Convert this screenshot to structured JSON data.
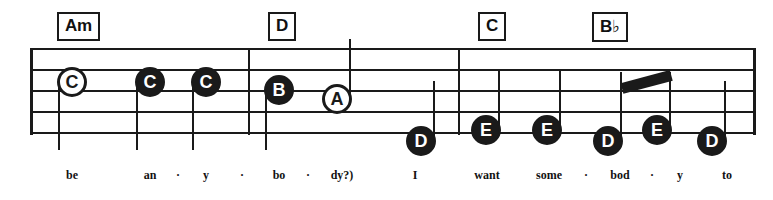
{
  "sheet": {
    "width": 773,
    "height": 200,
    "ink_color": "#1a1a1a",
    "paper_color": "#ffffff"
  },
  "staff": {
    "line_count": 5,
    "left": 30,
    "right": 753,
    "top": 48,
    "bottom": 133,
    "line_spacing": 21,
    "barlines": [
      30,
      248,
      458,
      753
    ]
  },
  "chords": [
    {
      "id": "chord-am",
      "label": "Am",
      "root": "A",
      "quality": "m",
      "accidental": "",
      "x": 57,
      "y": 12
    },
    {
      "id": "chord-d",
      "label": "D",
      "root": "D",
      "quality": "",
      "accidental": "",
      "x": 268,
      "y": 12
    },
    {
      "id": "chord-c",
      "label": "C",
      "root": "C",
      "quality": "",
      "accidental": "",
      "x": 478,
      "y": 12
    },
    {
      "id": "chord-bb",
      "label": "B",
      "root": "B",
      "quality": "",
      "accidental": "♭",
      "x": 592,
      "y": 12
    }
  ],
  "notes": [
    {
      "id": "note-1",
      "letter": "C",
      "head": "hollow",
      "duration": "half",
      "cx": 72,
      "cy": 82,
      "stem": "down"
    },
    {
      "id": "note-2",
      "letter": "C",
      "head": "filled",
      "duration": "quarter",
      "cx": 150,
      "cy": 82,
      "stem": "down"
    },
    {
      "id": "note-3",
      "letter": "C",
      "head": "filled",
      "duration": "quarter",
      "cx": 206,
      "cy": 82,
      "stem": "down"
    },
    {
      "id": "note-4",
      "letter": "B",
      "head": "filled",
      "duration": "quarter",
      "cx": 279,
      "cy": 90,
      "stem": "down"
    },
    {
      "id": "note-5",
      "letter": "A",
      "head": "hollow",
      "duration": "half",
      "cx": 337,
      "cy": 99,
      "stem": "up"
    },
    {
      "id": "note-6",
      "letter": "D",
      "head": "filled",
      "duration": "quarter",
      "cx": 421,
      "cy": 141,
      "stem": "up"
    },
    {
      "id": "note-7",
      "letter": "E",
      "head": "filled",
      "duration": "quarter",
      "cx": 486,
      "cy": 130,
      "stem": "up"
    },
    {
      "id": "note-8",
      "letter": "E",
      "head": "filled",
      "duration": "quarter",
      "cx": 547,
      "cy": 130,
      "stem": "up"
    },
    {
      "id": "note-9",
      "letter": "D",
      "head": "filled",
      "duration": "eighth",
      "cx": 608,
      "cy": 141,
      "stem": "up",
      "beam_group": 1
    },
    {
      "id": "note-10",
      "letter": "E",
      "head": "filled",
      "duration": "eighth",
      "cx": 657,
      "cy": 130,
      "stem": "up",
      "beam_group": 1
    },
    {
      "id": "note-11",
      "letter": "D",
      "head": "filled",
      "duration": "quarter",
      "cx": 712,
      "cy": 141,
      "stem": "up"
    }
  ],
  "beams": [
    {
      "id": "beam-1",
      "from_x": 622,
      "from_y": 83,
      "to_x": 671,
      "to_y": 70,
      "thickness": 11
    }
  ],
  "lyrics": [
    {
      "id": "lyric-1",
      "text": "be",
      "x": 72,
      "type": "syllable"
    },
    {
      "id": "lyric-2",
      "text": "an",
      "x": 150,
      "type": "syllable"
    },
    {
      "id": "lyric-3",
      "text": "·",
      "x": 178,
      "type": "dash"
    },
    {
      "id": "lyric-4",
      "text": "y",
      "x": 206,
      "type": "syllable"
    },
    {
      "id": "lyric-5",
      "text": "·",
      "x": 242,
      "type": "dash"
    },
    {
      "id": "lyric-6",
      "text": "bo",
      "x": 279,
      "type": "syllable"
    },
    {
      "id": "lyric-7",
      "text": "·",
      "x": 308,
      "type": "dash"
    },
    {
      "id": "lyric-8",
      "text": "dy?)",
      "x": 342,
      "type": "syllable"
    },
    {
      "id": "lyric-9",
      "text": "I",
      "x": 415,
      "type": "syllable"
    },
    {
      "id": "lyric-10",
      "text": "want",
      "x": 487,
      "type": "syllable"
    },
    {
      "id": "lyric-11",
      "text": "some",
      "x": 549,
      "type": "syllable"
    },
    {
      "id": "lyric-12",
      "text": "·",
      "x": 586,
      "type": "dash"
    },
    {
      "id": "lyric-13",
      "text": "bod",
      "x": 620,
      "type": "syllable"
    },
    {
      "id": "lyric-14",
      "text": "·",
      "x": 652,
      "type": "dash"
    },
    {
      "id": "lyric-15",
      "text": "y",
      "x": 680,
      "type": "syllable"
    },
    {
      "id": "lyric-16",
      "text": "to",
      "x": 727,
      "type": "syllable"
    }
  ]
}
